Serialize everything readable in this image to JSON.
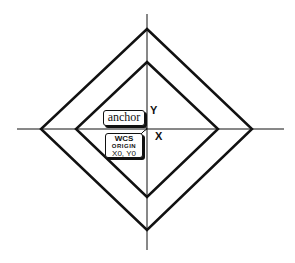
{
  "diagram": {
    "labels": {
      "y_axis": "Y",
      "x_axis": "X",
      "anchor": "anchor",
      "wcs_origin": {
        "line1": "WCS",
        "line2": "ORIGIN",
        "line3": "X0, Y0"
      }
    },
    "colors": {
      "stroke": "#111111",
      "background": "#ffffff"
    }
  }
}
